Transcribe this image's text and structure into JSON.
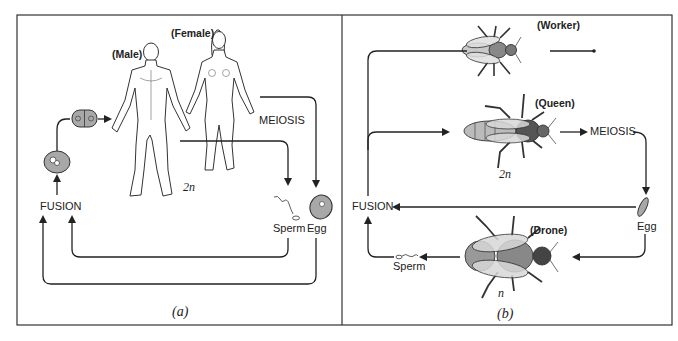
{
  "panel_a": {
    "caption": "(a)",
    "labels": {
      "male": "(Male)",
      "female": "(Female)",
      "meiosis": "MEIOSIS",
      "ploidy": "2n",
      "fusion": "FUSION",
      "sperm": "Sperm",
      "egg": "Egg"
    }
  },
  "panel_b": {
    "caption": "(b)",
    "labels": {
      "worker": "(Worker)",
      "queen": "(Queen)",
      "drone": "(Drone)",
      "meiosis": "MEIOSIS",
      "queen_ploidy": "2n",
      "drone_ploidy": "n",
      "fusion": "FUSION",
      "sperm": "Sperm",
      "egg": "Egg"
    }
  },
  "colors": {
    "line": "#222222",
    "cell_fill": "#a8a8a8",
    "frame": "#333333"
  }
}
